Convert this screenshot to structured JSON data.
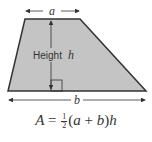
{
  "diagram": {
    "shape": "trapezoid",
    "fill_color": "#c4c4c4",
    "stroke_color": "#333333",
    "labels": {
      "top_base": "a",
      "bottom_base": "b",
      "height_word": "Height",
      "height_var": "h"
    },
    "formula": {
      "lhs": "A",
      "equals": "=",
      "frac_num": "1",
      "frac_den": "2",
      "paren_open": "(",
      "var_a": "a",
      "plus": " + ",
      "var_b": "b",
      "paren_close": ")",
      "var_h": "h"
    }
  }
}
